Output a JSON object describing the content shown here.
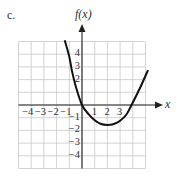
{
  "part_label": "c.",
  "chart_data": {
    "type": "line",
    "title": "",
    "xlabel": "x",
    "ylabel": "f(x)",
    "xlim": [
      -5,
      5
    ],
    "ylim": [
      -5,
      5
    ],
    "grid": true,
    "x_ticks": [
      "-4",
      "-3",
      "-2",
      "-1",
      "1",
      "2",
      "3"
    ],
    "y_ticks": [
      "4",
      "3",
      "2",
      "-1",
      "-2",
      "-3",
      "-4"
    ],
    "series": [
      {
        "name": "f(x)",
        "x": [
          -1.36,
          -1.0,
          -0.79,
          -0.5,
          0,
          0.5,
          1,
          1.5,
          2,
          2.5,
          3,
          3.5,
          3.9,
          4.5,
          5.2
        ],
        "y": [
          5.1,
          3.8,
          2.68,
          1.5,
          0,
          -0.7,
          -1.2,
          -1.5,
          -1.57,
          -1.5,
          -1.24,
          -0.75,
          0,
          1.2,
          2.75
        ]
      }
    ],
    "color": "#111111"
  },
  "colors": {
    "grid": "#c8c8c8",
    "axis": "#222222",
    "curve": "#111111"
  }
}
